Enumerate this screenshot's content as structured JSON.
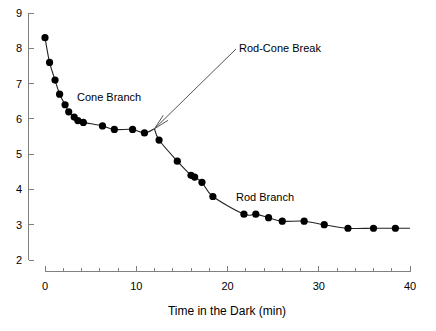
{
  "chart_data": {
    "type": "scatter",
    "title": "",
    "subtitle": "",
    "xlabel": "Time in the Dark (min)",
    "ylabel": "",
    "xlim": [
      0,
      40
    ],
    "ylim": [
      2,
      9
    ],
    "xticks": [
      0,
      10,
      20,
      30,
      40
    ],
    "xtick_labels": [
      "0",
      "10",
      "20",
      "30",
      "40"
    ],
    "xminor_step": 2,
    "yticks": [
      2,
      3,
      4,
      5,
      6,
      7,
      8,
      9
    ],
    "ytick_labels": [
      "2",
      "3",
      "4",
      "5",
      "6",
      "7",
      "8",
      "9"
    ],
    "grid": false,
    "legend": "none",
    "marker": "filled-circle",
    "marker_color": "#000000",
    "curve_color": "#222222",
    "axis_color": "#808080",
    "series": [
      {
        "name": "Cone Branch",
        "points": [
          [
            0.0,
            8.3
          ],
          [
            0.5,
            7.6
          ],
          [
            1.1,
            7.1
          ],
          [
            1.6,
            6.7
          ],
          [
            2.2,
            6.4
          ],
          [
            2.6,
            6.2
          ],
          [
            3.2,
            6.05
          ],
          [
            3.6,
            5.95
          ],
          [
            4.2,
            5.9
          ],
          [
            6.3,
            5.8
          ],
          [
            7.6,
            5.7
          ],
          [
            9.6,
            5.7
          ],
          [
            10.9,
            5.6
          ]
        ]
      },
      {
        "name": "Rod Branch",
        "points": [
          [
            12.5,
            5.4
          ],
          [
            14.5,
            4.8
          ],
          [
            16.0,
            4.4
          ],
          [
            16.4,
            4.35
          ],
          [
            17.2,
            4.2
          ],
          [
            18.4,
            3.8
          ],
          [
            21.8,
            3.3
          ],
          [
            23.1,
            3.3
          ],
          [
            24.5,
            3.2
          ],
          [
            26.0,
            3.1
          ],
          [
            28.4,
            3.1
          ],
          [
            30.6,
            3.0
          ],
          [
            33.2,
            2.9
          ],
          [
            36.0,
            2.9
          ],
          [
            38.4,
            2.9
          ]
        ]
      }
    ],
    "annotations": [
      {
        "id": "cone-branch-label",
        "text": "Cone Branch",
        "x": 6.0,
        "y": 6.45,
        "has_arrow": false
      },
      {
        "id": "rod-cone-break-label",
        "text": "Rod-Cone Break",
        "x": 22.4,
        "y": 8.1,
        "has_arrow": true,
        "arrow_target_x": 12.0,
        "arrow_target_y": 5.72
      },
      {
        "id": "rod-branch-label",
        "text": "Rod Branch",
        "x": 26.5,
        "y": 3.95,
        "has_arrow": false
      }
    ],
    "break_point": {
      "x": 12.0,
      "y": 5.72,
      "label": "Rod-Cone Break"
    }
  },
  "axis": {
    "x_title": "Time in the Dark (min)",
    "y_title": ""
  }
}
